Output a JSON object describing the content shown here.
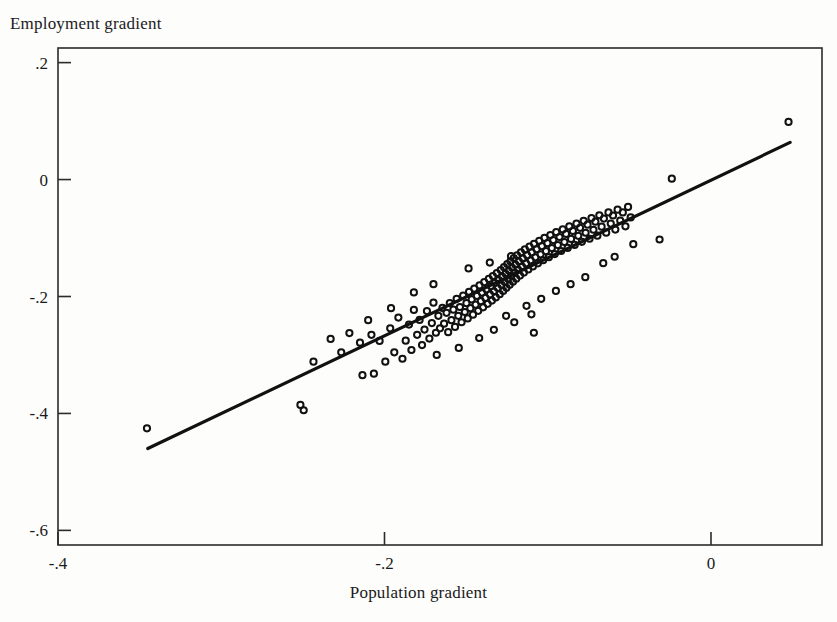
{
  "chart_data": {
    "type": "scatter",
    "title": "",
    "xlabel": "Population gradient",
    "ylabel": "Employment gradient",
    "xlim": [
      -0.4,
      0.068
    ],
    "ylim": [
      -0.625,
      0.225
    ],
    "xticks": [
      -0.4,
      -0.2,
      0.0
    ],
    "xticklabels": [
      "-.4",
      "-.2",
      "0"
    ],
    "yticks": [
      0.2,
      0.0,
      -0.2,
      -0.4,
      -0.6
    ],
    "yticklabels": [
      ".2",
      "0",
      "-.2",
      "-.4",
      "-.6"
    ],
    "grid": false,
    "legend": null,
    "marker": "open-circle",
    "marker_size_px": 8,
    "n_points": 192,
    "fit_line": {
      "type": "linear",
      "x_start": -0.345,
      "y_start": -0.46,
      "x_end": 0.0485,
      "y_end": 0.0635,
      "slope": 1.328,
      "intercept": -0.0036
    },
    "points": [
      [
        -0.3455,
        -0.4255
      ],
      [
        -0.2515,
        -0.3855
      ],
      [
        -0.2495,
        -0.3945
      ],
      [
        -0.2435,
        -0.3115
      ],
      [
        -0.233,
        -0.2725
      ],
      [
        -0.2265,
        -0.2955
      ],
      [
        -0.2215,
        -0.2625
      ],
      [
        -0.215,
        -0.279
      ],
      [
        -0.2135,
        -0.3345
      ],
      [
        -0.208,
        -0.2655
      ],
      [
        -0.2065,
        -0.332
      ],
      [
        -0.203,
        -0.276
      ],
      [
        -0.1995,
        -0.3115
      ],
      [
        -0.1965,
        -0.2545
      ],
      [
        -0.194,
        -0.2955
      ],
      [
        -0.1915,
        -0.236
      ],
      [
        -0.189,
        -0.3065
      ],
      [
        -0.187,
        -0.2755
      ],
      [
        -0.185,
        -0.248
      ],
      [
        -0.1835,
        -0.2915
      ],
      [
        -0.182,
        -0.223
      ],
      [
        -0.18,
        -0.2655
      ],
      [
        -0.1785,
        -0.24
      ],
      [
        -0.177,
        -0.283
      ],
      [
        -0.1755,
        -0.2565
      ],
      [
        -0.174,
        -0.225
      ],
      [
        -0.1725,
        -0.272
      ],
      [
        -0.171,
        -0.2455
      ],
      [
        -0.17,
        -0.2105
      ],
      [
        -0.1685,
        -0.262
      ],
      [
        -0.167,
        -0.233
      ],
      [
        -0.166,
        -0.2545
      ],
      [
        -0.1645,
        -0.2195
      ],
      [
        -0.1635,
        -0.2465
      ],
      [
        -0.162,
        -0.228
      ],
      [
        -0.161,
        -0.261
      ],
      [
        -0.16,
        -0.2115
      ],
      [
        -0.159,
        -0.2405
      ],
      [
        -0.1578,
        -0.2225
      ],
      [
        -0.1568,
        -0.252
      ],
      [
        -0.1558,
        -0.204
      ],
      [
        -0.1548,
        -0.233
      ],
      [
        -0.1538,
        -0.218
      ],
      [
        -0.1528,
        -0.244
      ],
      [
        -0.1518,
        -0.1985
      ],
      [
        -0.1508,
        -0.2265
      ],
      [
        -0.1498,
        -0.2115
      ],
      [
        -0.149,
        -0.2375
      ],
      [
        -0.1482,
        -0.192
      ],
      [
        -0.1474,
        -0.22
      ],
      [
        -0.1466,
        -0.205
      ],
      [
        -0.1458,
        -0.231
      ],
      [
        -0.145,
        -0.1865
      ],
      [
        -0.1442,
        -0.214
      ],
      [
        -0.1434,
        -0.199
      ],
      [
        -0.1426,
        -0.2245
      ],
      [
        -0.1418,
        -0.181
      ],
      [
        -0.141,
        -0.208
      ],
      [
        -0.1403,
        -0.1935
      ],
      [
        -0.1396,
        -0.2185
      ],
      [
        -0.1389,
        -0.1755
      ],
      [
        -0.1382,
        -0.2025
      ],
      [
        -0.1375,
        -0.188
      ],
      [
        -0.1368,
        -0.2125
      ],
      [
        -0.1361,
        -0.17
      ],
      [
        -0.1354,
        -0.1965
      ],
      [
        -0.1348,
        -0.1825
      ],
      [
        -0.1342,
        -0.207
      ],
      [
        -0.1336,
        -0.165
      ],
      [
        -0.133,
        -0.191
      ],
      [
        -0.1324,
        -0.177
      ],
      [
        -0.1318,
        -0.2015
      ],
      [
        -0.1312,
        -0.16
      ],
      [
        -0.1306,
        -0.1855
      ],
      [
        -0.13,
        -0.1718
      ],
      [
        -0.1294,
        -0.196
      ],
      [
        -0.1288,
        -0.1548
      ],
      [
        -0.1283,
        -0.1802
      ],
      [
        -0.1278,
        -0.1665
      ],
      [
        -0.1273,
        -0.1905
      ],
      [
        -0.1268,
        -0.1498
      ],
      [
        -0.1263,
        -0.175
      ],
      [
        -0.1258,
        -0.1612
      ],
      [
        -0.1253,
        -0.1852
      ],
      [
        -0.1248,
        -0.1445
      ],
      [
        -0.1243,
        -0.1698
      ],
      [
        -0.1238,
        -0.156
      ],
      [
        -0.1233,
        -0.18
      ],
      [
        -0.1228,
        -0.1395
      ],
      [
        -0.1223,
        -0.1645
      ],
      [
        -0.1218,
        -0.1508
      ],
      [
        -0.1213,
        -0.1748
      ],
      [
        -0.1208,
        -0.1345
      ],
      [
        -0.1203,
        -0.1592
      ],
      [
        -0.1198,
        -0.1455
      ],
      [
        -0.1193,
        -0.1695
      ],
      [
        -0.1188,
        -0.1295
      ],
      [
        -0.1182,
        -0.154
      ],
      [
        -0.1176,
        -0.1402
      ],
      [
        -0.117,
        -0.1642
      ],
      [
        -0.1164,
        -0.1245
      ],
      [
        -0.1158,
        -0.1488
      ],
      [
        -0.1152,
        -0.135
      ],
      [
        -0.1146,
        -0.159
      ],
      [
        -0.114,
        -0.1195
      ],
      [
        -0.1133,
        -0.1435
      ],
      [
        -0.1126,
        -0.1298
      ],
      [
        -0.1119,
        -0.1538
      ],
      [
        -0.1112,
        -0.1148
      ],
      [
        -0.1105,
        -0.1382
      ],
      [
        -0.1098,
        -0.1245
      ],
      [
        -0.1091,
        -0.1485
      ],
      [
        -0.1084,
        -0.1098
      ],
      [
        -0.1076,
        -0.133
      ],
      [
        -0.1068,
        -0.1192
      ],
      [
        -0.106,
        -0.1432
      ],
      [
        -0.1052,
        -0.1048
      ],
      [
        -0.1044,
        -0.1278
      ],
      [
        -0.1036,
        -0.114
      ],
      [
        -0.1028,
        -0.138
      ],
      [
        -0.102,
        -0.0998
      ],
      [
        -0.1011,
        -0.1225
      ],
      [
        -0.1002,
        -0.1088
      ],
      [
        -0.0993,
        -0.1328
      ],
      [
        -0.0984,
        -0.095
      ],
      [
        -0.0975,
        -0.1172
      ],
      [
        -0.0966,
        -0.1035
      ],
      [
        -0.0957,
        -0.1275
      ],
      [
        -0.0948,
        -0.09
      ],
      [
        -0.0938,
        -0.112
      ],
      [
        -0.0928,
        -0.0982
      ],
      [
        -0.0918,
        -0.1222
      ],
      [
        -0.0908,
        -0.0852
      ],
      [
        -0.0898,
        -0.1068
      ],
      [
        -0.0888,
        -0.093
      ],
      [
        -0.0878,
        -0.117
      ],
      [
        -0.0868,
        -0.0802
      ],
      [
        -0.0857,
        -0.1015
      ],
      [
        -0.0846,
        -0.0878
      ],
      [
        -0.0835,
        -0.1118
      ],
      [
        -0.0824,
        -0.0755
      ],
      [
        -0.0813,
        -0.0962
      ],
      [
        -0.0802,
        -0.0825
      ],
      [
        -0.0791,
        -0.1065
      ],
      [
        -0.078,
        -0.0705
      ],
      [
        -0.0768,
        -0.091
      ],
      [
        -0.0756,
        -0.0772
      ],
      [
        -0.0744,
        -0.1012
      ],
      [
        -0.0732,
        -0.0658
      ],
      [
        -0.072,
        -0.0858
      ],
      [
        -0.0708,
        -0.072
      ],
      [
        -0.0696,
        -0.096
      ],
      [
        -0.0684,
        -0.061
      ],
      [
        -0.067,
        -0.0805
      ],
      [
        -0.0656,
        -0.0668
      ],
      [
        -0.0642,
        -0.0908
      ],
      [
        -0.0628,
        -0.0562
      ],
      [
        -0.0614,
        -0.0752
      ],
      [
        -0.06,
        -0.0615
      ],
      [
        -0.0586,
        -0.0855
      ],
      [
        -0.0572,
        -0.0515
      ],
      [
        -0.0556,
        -0.07
      ],
      [
        -0.054,
        -0.0562
      ],
      [
        -0.0524,
        -0.08
      ],
      [
        -0.0508,
        -0.0468
      ],
      [
        -0.0492,
        -0.0648
      ],
      [
        -0.0476,
        -0.1105
      ],
      [
        -0.142,
        -0.271
      ],
      [
        -0.1545,
        -0.288
      ],
      [
        -0.168,
        -0.3
      ],
      [
        -0.1255,
        -0.233
      ],
      [
        -0.113,
        -0.216
      ],
      [
        -0.104,
        -0.204
      ],
      [
        -0.1485,
        -0.152
      ],
      [
        -0.1355,
        -0.142
      ],
      [
        -0.1225,
        -0.131
      ],
      [
        -0.17,
        -0.179
      ],
      [
        -0.182,
        -0.193
      ],
      [
        -0.095,
        -0.1905
      ],
      [
        -0.086,
        -0.179
      ],
      [
        -0.077,
        -0.167
      ],
      [
        -0.11,
        -0.2305
      ],
      [
        -0.066,
        -0.143
      ],
      [
        -0.059,
        -0.132
      ],
      [
        -0.024,
        0.0015
      ],
      [
        -0.0315,
        -0.1025
      ],
      [
        0.0475,
        0.0985
      ],
      [
        -0.21,
        -0.2405
      ],
      [
        -0.196,
        -0.22
      ],
      [
        -0.133,
        -0.257
      ],
      [
        -0.1205,
        -0.244
      ],
      [
        -0.1085,
        -0.262
      ]
    ]
  },
  "axis_geometry": {
    "plot_left_px": 58,
    "plot_right_px": 822,
    "plot_top_px": 48,
    "plot_bottom_px": 545
  }
}
